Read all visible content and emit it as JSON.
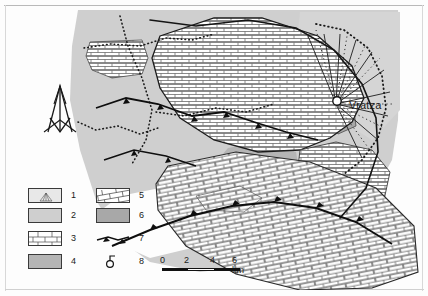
{
  "figure": {
    "type": "geological-map",
    "region_label": "Vratza"
  },
  "map": {
    "city_marker": {
      "name": "Vratza",
      "label": "Vratza",
      "marker_icon": "circle-settlement-marker"
    },
    "north_arrow": {
      "icon": "north-arrow-icon",
      "label": ""
    }
  },
  "legend": {
    "items": [
      {
        "number": "1",
        "symbol": "box-with-fan-symbol",
        "fill": "#e8e8e8"
      },
      {
        "number": "2",
        "symbol": "solid-light-gray-box",
        "fill": "#cfcfcf"
      },
      {
        "number": "3",
        "symbol": "horizontal-brick-pattern",
        "fill": "#ffffff"
      },
      {
        "number": "4",
        "symbol": "solid-medium-gray-box",
        "fill": "#b5b5b5"
      },
      {
        "number": "5",
        "symbol": "diagonal-brick-pattern",
        "fill": "#ffffff"
      },
      {
        "number": "6",
        "symbol": "solid-dark-gray-box",
        "fill": "#a8a8a8"
      },
      {
        "number": "7",
        "symbol": "thrust-fault-line",
        "fill": "none"
      },
      {
        "number": "8",
        "symbol": "borehole-symbol",
        "fill": "none"
      }
    ]
  },
  "scalebar": {
    "ticks": [
      "0",
      "2",
      "4",
      "6 km"
    ],
    "unit": "km",
    "max_value": "6"
  },
  "colors": {
    "gray_light": "#cfcfcf",
    "gray_mid": "#b5b5b5",
    "gray_dark": "#a8a8a8",
    "line": "#1a1a1a",
    "background": "#fdfdfd"
  }
}
